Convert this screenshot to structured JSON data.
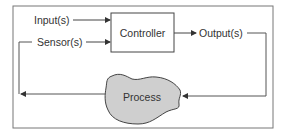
{
  "diagram": {
    "type": "control-loop",
    "nodes": {
      "controller": {
        "label": "Controller"
      },
      "process": {
        "label": "Process"
      }
    },
    "labels": {
      "inputs": "Input(s)",
      "sensors": "Sensor(s)",
      "outputs": "Output(s)"
    },
    "edges": [
      {
        "from": "inputs",
        "to": "controller"
      },
      {
        "from": "sensors",
        "to": "controller"
      },
      {
        "from": "controller",
        "to": "outputs"
      },
      {
        "from": "outputs",
        "to": "process"
      },
      {
        "from": "process",
        "to": "sensors"
      }
    ],
    "colors": {
      "line": "#555555",
      "text": "#333333",
      "process_fill": "#cfcfcf",
      "frame": "#777777"
    }
  }
}
